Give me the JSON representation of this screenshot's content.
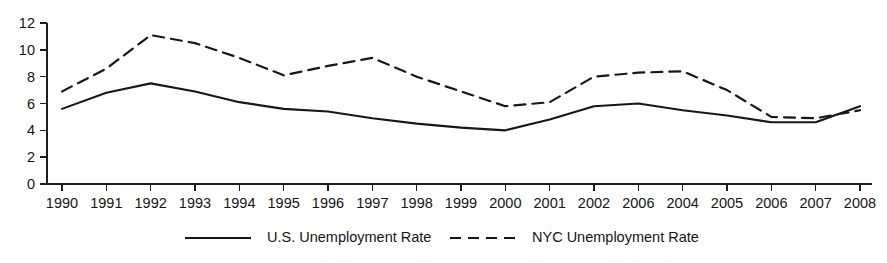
{
  "chart_data": {
    "type": "line",
    "title": "",
    "subtitle": "",
    "xlabel": "",
    "ylabel": "",
    "grid": false,
    "legend_position": "bottom",
    "ylim": [
      0,
      12
    ],
    "y_ticks": [
      0,
      2,
      4,
      6,
      8,
      10,
      12
    ],
    "categories": [
      "1990",
      "1991",
      "1992",
      "1993",
      "1994",
      "1995",
      "1996",
      "1997",
      "1998",
      "1999",
      "2000",
      "2001",
      "2002",
      "2006",
      "2004",
      "2005",
      "2006",
      "2007",
      "2008"
    ],
    "series": [
      {
        "name": "U.S. Unemployment Rate",
        "style": "solid",
        "color": "#171717",
        "values": [
          5.6,
          6.8,
          7.5,
          6.9,
          6.1,
          5.6,
          5.4,
          4.9,
          4.5,
          4.2,
          4.0,
          4.8,
          5.8,
          6.0,
          5.5,
          5.1,
          4.6,
          4.6,
          5.8
        ]
      },
      {
        "name": "NYC Unemployment Rate",
        "style": "dashed",
        "color": "#171717",
        "values": [
          6.9,
          8.6,
          11.1,
          10.5,
          9.4,
          8.1,
          8.8,
          9.4,
          8.0,
          6.9,
          5.8,
          6.1,
          8.0,
          8.3,
          8.4,
          7.0,
          5.0,
          4.9,
          5.5
        ]
      }
    ]
  },
  "legend": {
    "items": [
      {
        "label": "U.S. Unemployment Rate",
        "style": "solid"
      },
      {
        "label": "NYC Unemployment Rate",
        "style": "dashed"
      }
    ]
  },
  "colors": {
    "ink": "#171717",
    "axis": "#1d1d1d",
    "background": "#ffffff"
  }
}
